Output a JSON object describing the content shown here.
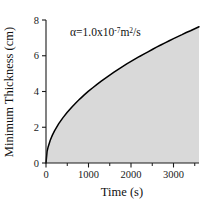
{
  "chart_data": {
    "type": "area",
    "title": "",
    "xlabel": "Time (s)",
    "ylabel": "Minimum Thickness (cm)",
    "xlim": [
      0,
      3600
    ],
    "ylim": [
      0,
      8
    ],
    "grid": false,
    "legend": null,
    "fill_color": "#d9d9d9",
    "line_color": "#000000",
    "x_ticks_major": [
      0,
      1000,
      2000,
      3000
    ],
    "x_tick_labels": [
      "0",
      "1000",
      "2000",
      "3000"
    ],
    "x_ticks_minor": [
      500,
      1500,
      2500,
      3500
    ],
    "y_ticks_major": [
      0,
      2,
      4,
      6,
      8
    ],
    "y_tick_labels": [
      "0",
      "2",
      "4",
      "6",
      "8"
    ],
    "annotations": [
      {
        "name": "alpha-annotation",
        "prefix": "α=1.0x10",
        "exponent": "-7",
        "middle": "m",
        "exponent2": "2",
        "suffix": "/s",
        "full_text": "α=1.0x10-7m2/s",
        "x": 1000,
        "y": 7.2
      }
    ],
    "series": [
      {
        "name": "minimum thickness",
        "relation": "y = 0.1270 * sqrt(t)",
        "x": [
          0,
          25,
          50,
          100,
          150,
          200,
          300,
          400,
          500,
          600,
          700,
          800,
          900,
          1000,
          1100,
          1200,
          1300,
          1400,
          1500,
          1600,
          1700,
          1800,
          1900,
          2000,
          2100,
          2200,
          2300,
          2400,
          2500,
          2600,
          2700,
          2800,
          2900,
          3000,
          3100,
          3200,
          3300,
          3400,
          3500,
          3600
        ],
        "values": [
          0,
          0.64,
          0.9,
          1.27,
          1.56,
          1.8,
          2.2,
          2.54,
          2.84,
          3.11,
          3.36,
          3.59,
          3.81,
          4.02,
          4.21,
          4.4,
          4.58,
          4.75,
          4.92,
          5.08,
          5.24,
          5.39,
          5.54,
          5.68,
          5.82,
          5.96,
          6.09,
          6.22,
          6.35,
          6.48,
          6.6,
          6.72,
          6.84,
          6.96,
          7.07,
          7.18,
          7.3,
          7.4,
          7.51,
          7.62
        ]
      }
    ]
  },
  "figure": {
    "x_axis_title": "Time (s)",
    "y_axis_title": "Minimum Thickness (cm)"
  }
}
